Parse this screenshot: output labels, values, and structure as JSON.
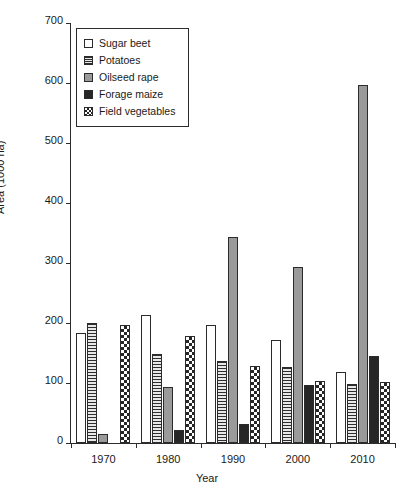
{
  "chart_data": {
    "type": "bar",
    "title": "",
    "xlabel": "Year",
    "ylabel": "Area (1000 ha)",
    "categories": [
      "1970",
      "1980",
      "1990",
      "2000",
      "2010"
    ],
    "ylim": [
      0,
      700
    ],
    "yticks": [
      0,
      100,
      200,
      300,
      400,
      500,
      600,
      700
    ],
    "ytick_labels": [
      "0",
      "100",
      "200",
      "300",
      "400",
      "500",
      "600",
      "700"
    ],
    "grid": false,
    "legend_position": "upper-left inside",
    "series": [
      {
        "name": "Sugar beet",
        "fill": "white",
        "values": [
          183,
          213,
          196,
          172,
          118
        ]
      },
      {
        "name": "Potatoes",
        "fill": "horizontal-lines",
        "values": [
          200,
          149,
          136,
          126,
          99
        ]
      },
      {
        "name": "Oilseed rape",
        "fill": "solid-gray",
        "values": [
          15,
          93,
          343,
          294,
          596
        ]
      },
      {
        "name": "Forage maize",
        "fill": "solid-black",
        "values": [
          0,
          22,
          32,
          97,
          145
        ]
      },
      {
        "name": "Field vegetables",
        "fill": "checkerboard",
        "values": [
          197,
          179,
          129,
          103,
          101
        ]
      }
    ]
  },
  "legend": {
    "items": [
      {
        "label": "Sugar beet",
        "swatch": "white-square-icon"
      },
      {
        "label": "Potatoes",
        "swatch": "hatched-square-icon"
      },
      {
        "label": "Oilseed rape",
        "swatch": "gray-square-icon"
      },
      {
        "label": "Forage maize",
        "swatch": "black-square-icon"
      },
      {
        "label": "Field vegetables",
        "swatch": "checkered-square-icon"
      }
    ]
  },
  "colors": {
    "axis": "#2b2b2b",
    "text": "#1a1a1a",
    "oilseed_rape": "#9a9a9a",
    "forage_maize": "#262626",
    "background": "#ffffff"
  }
}
